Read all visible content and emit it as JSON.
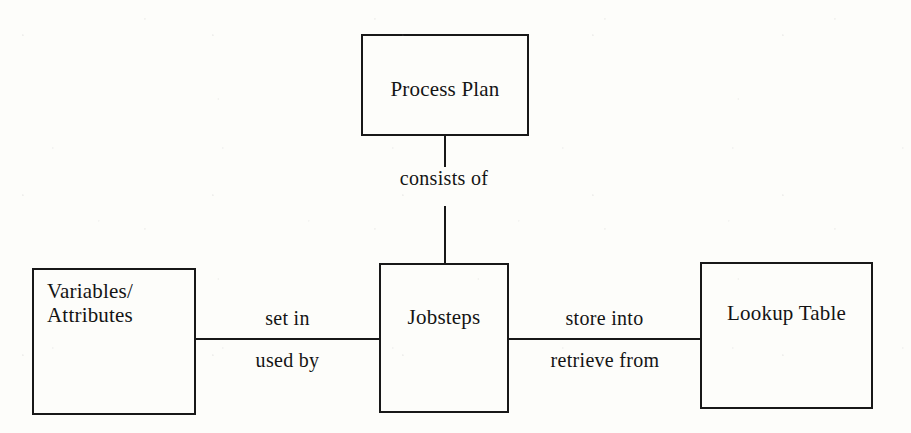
{
  "diagram": {
    "type": "entity-relationship-diagram",
    "background_color": "#fdfdfa",
    "line_color": "#181818",
    "text_color": "#141414",
    "nodes": [
      {
        "id": "process-plan",
        "label": "Process Plan",
        "x": 361,
        "y": 34,
        "w": 168,
        "h": 102,
        "text_align": "center",
        "label_top": 42
      },
      {
        "id": "variables-attributes",
        "label": "Variables/\nAttributes",
        "x": 32,
        "y": 268,
        "w": 164,
        "h": 147,
        "text_align": "left",
        "label_top": 10
      },
      {
        "id": "jobsteps",
        "label": "Jobsteps",
        "x": 379,
        "y": 263,
        "w": 130,
        "h": 150,
        "text_align": "center",
        "label_top": 41
      },
      {
        "id": "lookup-table",
        "label": "Lookup Table",
        "x": 700,
        "y": 262,
        "w": 173,
        "h": 147,
        "text_align": "center",
        "label_top": 38
      }
    ],
    "edges": [
      {
        "id": "process-plan-jobsteps",
        "from": "process-plan",
        "to": "jobsteps",
        "orientation": "vertical",
        "label": "consists of",
        "segments": [
          {
            "x": 444,
            "y": 135,
            "length": 32
          },
          {
            "x": 444,
            "y": 206,
            "length": 58
          }
        ],
        "label_box": {
          "x": 381,
          "y": 168,
          "w": 126
        }
      },
      {
        "id": "variables-jobsteps",
        "from": "variables-attributes",
        "to": "jobsteps",
        "orientation": "horizontal",
        "label_above": "set in",
        "label_below": "used by",
        "line": {
          "x": 195,
          "y": 338,
          "length": 185
        },
        "label_above_box": {
          "x": 215,
          "y": 308,
          "w": 145
        },
        "label_below_box": {
          "x": 215,
          "y": 350,
          "w": 145
        }
      },
      {
        "id": "jobsteps-lookup-table",
        "from": "jobsteps",
        "to": "lookup-table",
        "orientation": "horizontal",
        "label_above": "store into",
        "label_below": "retrieve from",
        "line": {
          "x": 508,
          "y": 338,
          "length": 193
        },
        "label_above_box": {
          "x": 527,
          "y": 308,
          "w": 155
        },
        "label_below_box": {
          "x": 522,
          "y": 350,
          "w": 166
        }
      }
    ]
  }
}
